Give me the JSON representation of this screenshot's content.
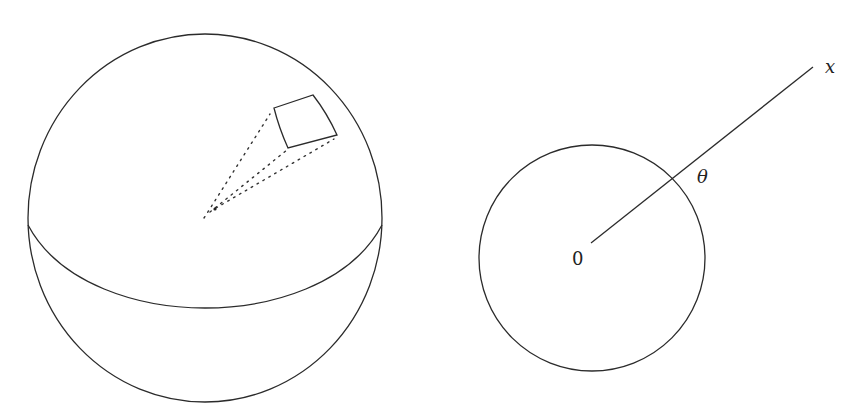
{
  "figure": {
    "left_panel": {
      "description": "Sphere with equator and a small surface patch connected by dotted lines to the center"
    },
    "right_panel": {
      "description": "Circle centered at origin with a ray from the origin through the circle",
      "labels": {
        "origin": "0",
        "angle": "θ",
        "ray_end": "x"
      }
    }
  }
}
